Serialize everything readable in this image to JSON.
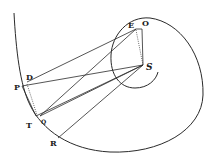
{
  "diagram": {
    "type": "geometric-figure",
    "labels": {
      "E": "E",
      "O": "O",
      "S": "S",
      "D": "D",
      "P": "P",
      "T": "T",
      "Q": "Q",
      "R": "R"
    },
    "points": {
      "E": [
        136,
        29
      ],
      "O": [
        142,
        29
      ],
      "S": [
        143,
        65
      ],
      "D": [
        27,
        82
      ],
      "P": [
        22,
        86
      ],
      "T": [
        36,
        116
      ],
      "Q": [
        40,
        116
      ],
      "R": [
        58,
        138
      ]
    },
    "segments": [
      {
        "from": "D",
        "to": "E",
        "style": "solid"
      },
      {
        "from": "P",
        "to": "S",
        "style": "solid"
      },
      {
        "from": "P",
        "to": "T",
        "style": "solid"
      },
      {
        "from": "D",
        "to": "T",
        "style": "dotted"
      },
      {
        "from": "Q",
        "to": "E",
        "style": "solid"
      },
      {
        "from": "T",
        "to": "S",
        "style": "solid"
      },
      {
        "from": "Q",
        "to": "S",
        "style": "solid"
      },
      {
        "from": "R",
        "to": "S",
        "style": "solid"
      },
      {
        "from": "E",
        "to": "O",
        "style": "solid"
      },
      {
        "from": "O",
        "to": "S",
        "style": "solid"
      },
      {
        "from": "E",
        "to": "S",
        "style": "dotted"
      }
    ],
    "colors": {
      "ink": "#2a2a2a",
      "background": "#ffffff"
    }
  }
}
